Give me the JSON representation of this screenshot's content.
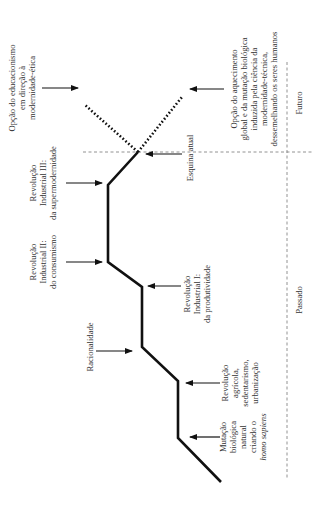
{
  "diagram": {
    "orientation": "rotated-90-ccw",
    "colors": {
      "line": "#111111",
      "text": "#333333",
      "divider": "#777777",
      "background": "#ffffff"
    },
    "eras": {
      "past": "Passado",
      "future": "Futuro"
    },
    "current_corner": "Esquina atual",
    "labels": {
      "educacionismo": [
        "Opção do educacionismo",
        "em direção à",
        "modernidade-ética"
      ],
      "aquecimento": [
        "Opção do aquecimento",
        "global e da mutação biológica",
        "induzida pela ciência da",
        "modernidade-técnica,",
        "dessemelhando os seres humanos"
      ],
      "rev_ind_3": [
        "Revolução",
        "Industrial III:",
        "da supermodernidade"
      ],
      "rev_ind_2": [
        "Revolução",
        "Industrial II:",
        "do consumismo"
      ],
      "rev_ind_1": [
        "Revolução",
        "Industrial I:",
        "da produtividade"
      ],
      "racionalidade": [
        "Racionalidade"
      ],
      "rev_agricola": [
        "Revolução",
        "agrícola,",
        "sedentarismo,",
        "urbanização"
      ],
      "mutacao": [
        "Mutação",
        "biológica",
        "natural",
        "criando o",
        "homo sapiens"
      ]
    }
  }
}
